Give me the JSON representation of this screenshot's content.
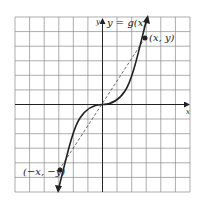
{
  "figure": {
    "function_label": "y = g(x)",
    "y_axis_label": "y",
    "x_axis_label": "x",
    "point_label_positive": "(x, y)",
    "point_label_negative": "(−x, −y)"
  },
  "grid": {
    "columns": 12,
    "rows": 12,
    "origin_col": 6,
    "origin_row": 6
  },
  "curve": {
    "type": "odd function (cubic-like)",
    "point_positive": [
      3,
      4.5
    ],
    "point_negative": [
      -3,
      -4.5
    ]
  },
  "colors": {
    "grid": "#8a8a8a",
    "axis": "#222222",
    "curve": "#222222"
  }
}
